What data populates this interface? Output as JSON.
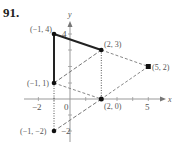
{
  "problem_number": "91.",
  "axes": {
    "x_label": "x",
    "y_label": "y",
    "x_ticks": [
      {
        "value": -2,
        "label": "−2"
      },
      {
        "value": 0,
        "label": "0"
      },
      {
        "value": 5,
        "label": "5"
      }
    ],
    "y_ticks": [
      {
        "value": 4,
        "label": "4"
      },
      {
        "value": -2,
        "label": "−2"
      }
    ]
  },
  "points": [
    {
      "id": "A",
      "x": -1,
      "y": 4,
      "label": "(−1, 4)"
    },
    {
      "id": "B",
      "x": 2,
      "y": 3,
      "label": "(2, 3)"
    },
    {
      "id": "C",
      "x": -1,
      "y": 1,
      "label": "(−1, 1)"
    },
    {
      "id": "D",
      "x": 5,
      "y": 2,
      "label": "(5, 2)"
    },
    {
      "id": "E",
      "x": 2,
      "y": 0,
      "label": "(2, 0)"
    },
    {
      "id": "F",
      "x": -1,
      "y": -2,
      "label": "(−1, −2)"
    }
  ],
  "segments": [
    {
      "from": "C",
      "to": "A",
      "style": "solid"
    },
    {
      "from": "A",
      "to": "B",
      "style": "solid"
    },
    {
      "from": "C",
      "to": "B",
      "style": "dashed"
    },
    {
      "from": "B",
      "to": "D",
      "style": "dashed"
    },
    {
      "from": "D",
      "to": "E",
      "style": "dashed"
    },
    {
      "from": "C",
      "to": "E",
      "style": "dashed"
    },
    {
      "from": "E",
      "to": "F",
      "style": "dashed"
    },
    {
      "from": "C",
      "to": "F",
      "style": "dotted"
    },
    {
      "from": "B",
      "to": "E",
      "style": "dotted"
    }
  ],
  "colors": {
    "solid": "#222222",
    "dashed": "#777777",
    "axis": "#999999",
    "point": "#111111"
  }
}
